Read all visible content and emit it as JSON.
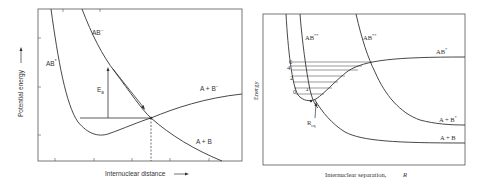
{
  "left_panel": {
    "ylabel": "Potential energy",
    "xlabel": "Internuclear distance",
    "curve_labels": {
      "ab_minus": "AB",
      "ab_minus_sup": "−",
      "ab_star": "AB",
      "ab_star_sup": "*",
      "a_plus_b_minus": "A + B",
      "a_plus_b_minus_sup": "−",
      "a_plus_b": "A + B"
    },
    "activation_label": "E",
    "activation_sub": "a"
  },
  "right_panel": {
    "ylabel": "Energy",
    "xlabel": "Internuclear separation,",
    "xlabel_symbol": "R",
    "curve_labels": {
      "ab_double_star_1": "AB",
      "ab_double_star_1_sup": "**",
      "ab_double_star_2": "AB",
      "ab_double_star_2_sup": "**",
      "ab_star": "AB",
      "ab_star_sup": "*",
      "a_plus_b_star": "A + B",
      "a_plus_b_star_sup": "*",
      "a_plus_b": "A + B"
    },
    "vibrational_levels": [
      "0",
      "2",
      "4",
      "6"
    ],
    "r_label": "R",
    "r_sub": "eq",
    "small_label": "4"
  }
}
